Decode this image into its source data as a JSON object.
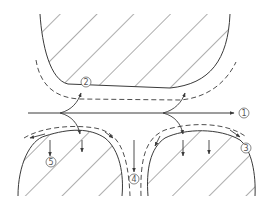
{
  "diagram": {
    "type": "flow-schematic",
    "colors": {
      "stroke": "#3a3a3a",
      "hatch": "#4a4a4a",
      "label": "#555555",
      "background": "#ffffff"
    },
    "labels": {
      "l1": "1",
      "l2": "2",
      "l3": "3",
      "l4": "4",
      "l5": "5"
    },
    "regions": [
      {
        "id": "upper-body",
        "hatched": true
      },
      {
        "id": "lower-left-body",
        "hatched": true
      },
      {
        "id": "lower-right-body",
        "hatched": true
      }
    ],
    "flows": [
      {
        "label": "1",
        "desc": "main horizontal flow through gap, exits right"
      },
      {
        "label": "2",
        "desc": "flow along underside of upper body (dashed)"
      },
      {
        "label": "3",
        "desc": "flow over top of lower-right body (dashed)"
      },
      {
        "label": "4",
        "desc": "downward flow through gap between lower bodies"
      },
      {
        "label": "5",
        "desc": "flow over top of lower-left body (dashed)"
      }
    ]
  }
}
